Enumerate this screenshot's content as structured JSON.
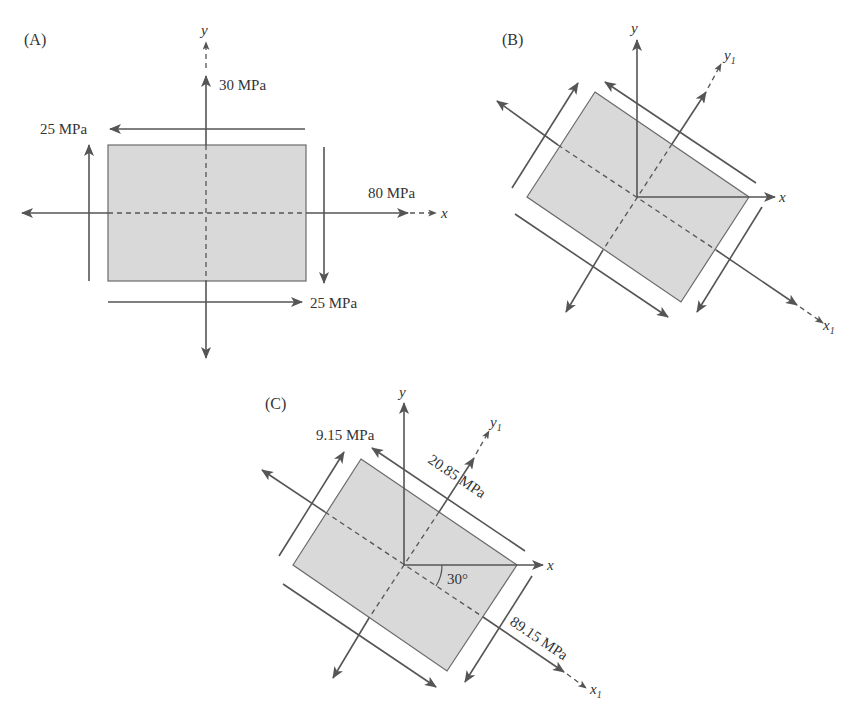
{
  "panels": {
    "A": {
      "label": "(A)",
      "axis_x": "x",
      "axis_y": "y",
      "stresses": {
        "normal_y": "30 MPa",
        "normal_x": "80 MPa",
        "shear_top": "25 MPa",
        "shear_bottom": "25 MPa"
      }
    },
    "B": {
      "label": "(B)",
      "axis_x": "x",
      "axis_y": "y",
      "axis_x1": "x",
      "axis_x1_sub": "1",
      "axis_y1": "y",
      "axis_y1_sub": "1"
    },
    "C": {
      "label": "(C)",
      "axis_x": "x",
      "axis_y": "y",
      "axis_x1": "x",
      "axis_x1_sub": "1",
      "axis_y1": "y",
      "axis_y1_sub": "1",
      "angle": "30°",
      "stresses": {
        "shear": "9.15 MPa",
        "normal_y1": "20.85 MPa",
        "normal_x1": "89.15 MPa"
      }
    }
  }
}
